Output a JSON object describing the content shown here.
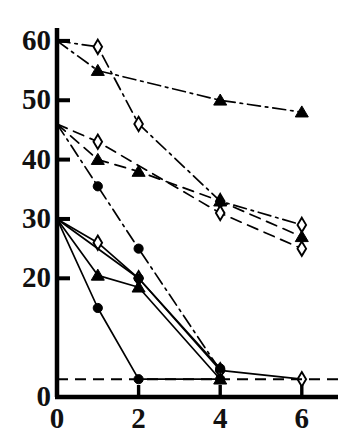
{
  "chart_data": {
    "type": "line",
    "title": "",
    "subtitle": "",
    "xlabel": "",
    "ylabel": "",
    "xlim": [
      0,
      7
    ],
    "ylim": [
      0,
      62
    ],
    "grid": false,
    "legend": "none",
    "axis_color": "#000000",
    "y_ticks": [
      0,
      20,
      30,
      40,
      50,
      60
    ],
    "y_tick_labels": [
      "0",
      "20",
      "30",
      "40",
      "50",
      "60"
    ],
    "x_ticks": [
      0,
      2,
      4,
      6
    ],
    "x_tick_labels": [
      "0",
      "2",
      "4",
      "6"
    ],
    "annotations": [
      {
        "name": "baseline-dashed",
        "type": "hline",
        "y": 3,
        "style": "dashed",
        "label": ""
      }
    ],
    "series": [
      {
        "name": "series-1-open-diamond-dashdot-60",
        "marker": "open-diamond",
        "line": "dashdot",
        "x": [
          0,
          1,
          2,
          4,
          6
        ],
        "y": [
          60,
          59,
          46,
          33,
          29
        ]
      },
      {
        "name": "series-2-filled-triangle-dashdot-60",
        "marker": "filled-triangle",
        "line": "dashdot",
        "x": [
          0,
          1,
          4,
          6
        ],
        "y": [
          60,
          55,
          50,
          48
        ]
      },
      {
        "name": "series-3-open-diamond-dashed-46",
        "marker": "open-diamond",
        "line": "dashed",
        "x": [
          0,
          1,
          4,
          6
        ],
        "y": [
          46,
          43,
          31,
          25
        ]
      },
      {
        "name": "series-4-filled-triangle-dashed-46",
        "marker": "filled-triangle",
        "line": "dashed",
        "x": [
          0,
          1,
          2,
          4,
          6
        ],
        "y": [
          46,
          40,
          38,
          33,
          27
        ]
      },
      {
        "name": "series-5-filled-circle-dashdot-46",
        "marker": "filled-circle",
        "line": "dashdot",
        "x": [
          0,
          1,
          2,
          4
        ],
        "y": [
          46,
          35.5,
          25,
          4.5
        ]
      },
      {
        "name": "series-6-open-diamond-solid-30",
        "marker": "open-diamond",
        "line": "solid",
        "x": [
          0,
          1,
          2,
          4,
          6
        ],
        "y": [
          30,
          26,
          20,
          4.5,
          3
        ]
      },
      {
        "name": "series-7-filled-triangle-solid-30",
        "marker": "filled-triangle",
        "line": "solid",
        "x": [
          0,
          1,
          2,
          4
        ],
        "y": [
          30,
          20.5,
          18.5,
          3
        ]
      },
      {
        "name": "series-8-filled-circle-solid-30",
        "marker": "filled-circle",
        "line": "solid",
        "x": [
          0,
          1,
          2,
          4
        ],
        "y": [
          30,
          15,
          3,
          3
        ]
      },
      {
        "name": "series-9-filled-circle-solid-30b",
        "marker": "filled-circle",
        "line": "solid",
        "x": [
          0,
          2,
          4
        ],
        "y": [
          30,
          20,
          4.8
        ]
      }
    ]
  },
  "axis": {
    "y_labels": [
      "60",
      "50",
      "40",
      "30",
      "20",
      "0"
    ],
    "x_labels": [
      "0",
      "2",
      "4",
      "6"
    ]
  }
}
